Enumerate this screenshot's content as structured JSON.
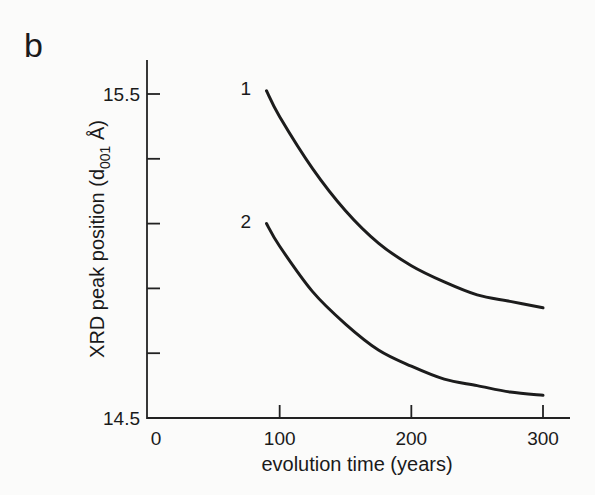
{
  "panel_label": "b",
  "chart_data": {
    "type": "line",
    "title": "",
    "xlabel": "evolution time (years)",
    "ylabel": "XRD peak position (d001 Å)",
    "ylabel_parts": {
      "main": "XRD peak position (d",
      "sub": "001",
      "unit": " Å)"
    },
    "xlim": [
      0,
      320
    ],
    "ylim": [
      14.5,
      15.6
    ],
    "x_ticks": [
      0,
      100,
      200,
      300
    ],
    "x_tick_labels": [
      "0",
      "100",
      "200",
      "300"
    ],
    "y_ticks": [
      14.5,
      14.7,
      14.9,
      15.1,
      15.3,
      15.5
    ],
    "y_tick_labels": {
      "14.5": "14.5",
      "15.5": "15.5"
    },
    "grid": false,
    "legend": "inline curve labels",
    "series": [
      {
        "name": "1",
        "x": [
          90,
          100,
          125,
          150,
          175,
          200,
          225,
          250,
          275,
          300
        ],
        "values": [
          15.51,
          15.43,
          15.27,
          15.14,
          15.04,
          14.97,
          14.92,
          14.88,
          14.86,
          14.84
        ]
      },
      {
        "name": "2",
        "x": [
          90,
          100,
          125,
          150,
          175,
          200,
          225,
          250,
          275,
          300
        ],
        "values": [
          15.1,
          15.03,
          14.89,
          14.79,
          14.71,
          14.66,
          14.62,
          14.6,
          14.58,
          14.57
        ]
      }
    ]
  }
}
